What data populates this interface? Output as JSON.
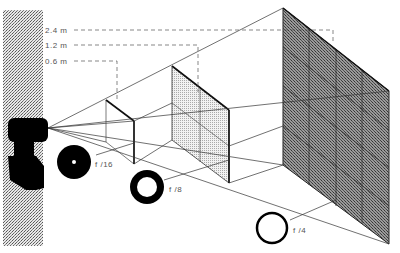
{
  "diagram": {
    "distance_labels": [
      {
        "text": "2.4 m",
        "y": 30
      },
      {
        "text": "1.2 m",
        "y": 45
      },
      {
        "text": "0.6 m",
        "y": 61
      }
    ],
    "aperture_labels": [
      {
        "text": "f /16"
      },
      {
        "text": "f /8"
      },
      {
        "text": "f /4"
      }
    ],
    "colors": {
      "line": "#333333",
      "ink": "#000000",
      "texture_light": "#cccccc",
      "panel_dark": "#7a7a7a",
      "panel_mid": "#d9d9d9"
    }
  }
}
